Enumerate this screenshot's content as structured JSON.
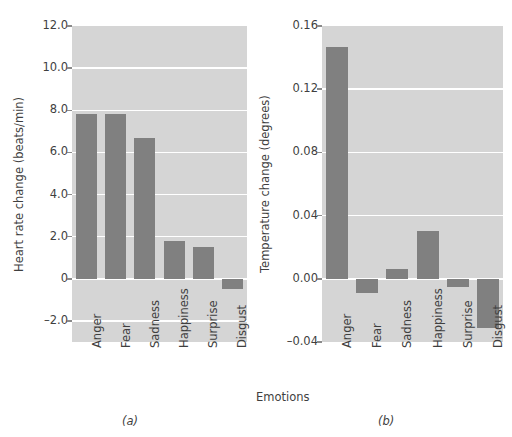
{
  "figure": {
    "panel_a_letter": "(a)",
    "panel_b_letter": "(b)",
    "x_axis_title": "Emotions"
  },
  "chart_data": [
    {
      "type": "bar",
      "panel": "(a)",
      "title": "",
      "xlabel": "Emotions",
      "ylabel": "Heart rate change (beats/min)",
      "categories": [
        "Anger",
        "Fear",
        "Sadness",
        "Happiness",
        "Surprise",
        "Disgust"
      ],
      "values": [
        7.8,
        7.8,
        6.7,
        1.8,
        1.5,
        -0.5
      ],
      "yticks": [
        "12.0",
        "10.0",
        "8.0",
        "6.0",
        "4.0",
        "2.0",
        "0",
        "-2.0"
      ],
      "ytick_values": [
        12.0,
        10.0,
        8.0,
        6.0,
        4.0,
        2.0,
        0,
        -2.0
      ],
      "ylim": [
        -3.0,
        12.0
      ],
      "grid": true,
      "legend": "none",
      "bar_color": "#808080",
      "plot_background": "#d5d5d5",
      "gridline_color": "#ffffff"
    },
    {
      "type": "bar",
      "panel": "(b)",
      "title": "",
      "xlabel": "Emotions",
      "ylabel": "Temperature change (degrees)",
      "categories": [
        "Anger",
        "Fear",
        "Sadness",
        "Happiness",
        "Surprise",
        "Disgust"
      ],
      "values": [
        0.147,
        -0.009,
        0.0065,
        0.03,
        -0.005,
        -0.031
      ],
      "yticks": [
        "0.16",
        "0.12",
        "0.08",
        "0.04",
        "0.00",
        "-0.04"
      ],
      "ytick_values": [
        0.16,
        0.12,
        0.08,
        0.04,
        0.0,
        -0.04
      ],
      "ylim": [
        -0.04,
        0.16
      ],
      "grid": true,
      "legend": "none",
      "bar_color": "#808080",
      "plot_background": "#d5d5d5",
      "gridline_color": "#ffffff"
    }
  ]
}
